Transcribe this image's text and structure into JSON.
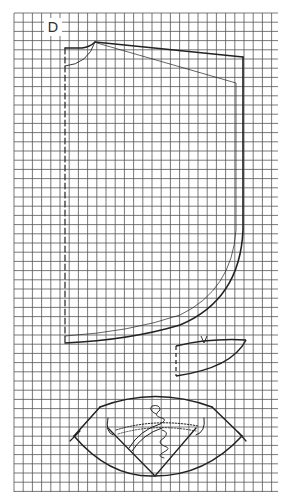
{
  "figure": {
    "label": "D",
    "grid": {
      "x0": 14,
      "y0": 13,
      "x1": 278,
      "y1": 492,
      "cell": 9.2,
      "color": "#555555"
    },
    "line_color": "#222222",
    "pieces": [
      {
        "name": "main-panel",
        "edges": [
          "dashed-fold-left",
          "neckline",
          "shoulder",
          "side",
          "curved-hem"
        ],
        "has_inner_seam_line": true
      },
      {
        "name": "small-facing",
        "notch_mark": "V"
      },
      {
        "name": "collar",
        "shape": "fan",
        "has_embroidery": true
      }
    ]
  }
}
